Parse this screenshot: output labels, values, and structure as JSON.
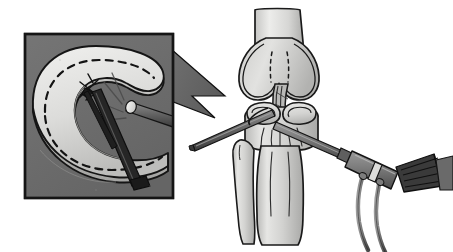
{
  "figure": {
    "title": "Arthroscopic meniscal repair of the knee",
    "description": "Medical line illustration. Left: shaded inset box with callout arrow showing magnified arthroscopic view of a C-shaped meniscus with a dashed tear line, a suture stitch, an arthroscope tip emitting light and a dark suture-passing instrument. Right: anterior view of the knee joint with distal femur, condyles, cruciate ligament, tibial plateau with both menisci, tibia and fibula, a probe entering from the left and an arthroscope with light-cable and two flexible tubes entering from the right.",
    "type": "medical-diagram",
    "width": 453,
    "height": 252,
    "background": "#ffffff"
  },
  "palette": {
    "page_background": "#ffffff",
    "inset_background": "#6e6e6e",
    "inset_border": "#1a1a1a",
    "callout_arrow_fill": "#6e6e6e",
    "callout_arrow_stroke": "#111111",
    "bone_light": "#e3e3e1",
    "bone_mid": "#c8c8c6",
    "bone_shadow": "#a6a6a4",
    "cartilage": "#d4d4d2",
    "meniscus_light": "#dedede",
    "meniscus_mid": "#bdbdbd",
    "outline": "#1a1a1a",
    "instrument_dark": "#2a2a2a",
    "instrument_mid": "#707070",
    "instrument_light": "#9a9a9a",
    "scope_body": "#7a7a7a",
    "scope_band": "#d8d8d8",
    "cable_fill": "#8a8a8a",
    "tear_line": "#141414"
  },
  "inset_panel": {
    "name": "magnified-arthroscopic-view",
    "label": "Magnified arthroscopic view of meniscus repair",
    "box": {
      "x": 25,
      "y": 34,
      "width": 148,
      "height": 164
    },
    "contents": [
      {
        "name": "meniscus-c-shape",
        "label": "C-shaped meniscus body"
      },
      {
        "name": "meniscus-tear-line",
        "label": "Dashed tear line along meniscus"
      },
      {
        "name": "suture-stitch",
        "label": "Suture stitch crossing the tear"
      },
      {
        "name": "grasper-instrument",
        "label": "Suture passing instrument"
      },
      {
        "name": "arthroscope-tip",
        "label": "Arthroscope tip with illumination"
      },
      {
        "name": "light-rays",
        "label": "Light rays from arthroscope"
      }
    ]
  },
  "callout": {
    "name": "callout-arrow",
    "label": "Callout arrow from knee joint to magnified inset",
    "direction": "left"
  },
  "knee_panel": {
    "name": "knee-joint-anterior-view",
    "label": "Anterior view of knee joint",
    "parts": [
      {
        "name": "femur-shaft",
        "label": "Femur shaft"
      },
      {
        "name": "medial-femoral-condyle",
        "label": "Medial femoral condyle"
      },
      {
        "name": "lateral-femoral-condyle",
        "label": "Lateral femoral condyle"
      },
      {
        "name": "intercondylar-notch",
        "label": "Intercondylar notch"
      },
      {
        "name": "cruciate-ligament",
        "label": "Cruciate ligament"
      },
      {
        "name": "medial-meniscus",
        "label": "Medial meniscus"
      },
      {
        "name": "lateral-meniscus",
        "label": "Lateral meniscus"
      },
      {
        "name": "tibial-plateau",
        "label": "Tibial plateau"
      },
      {
        "name": "tibia-shaft",
        "label": "Tibia shaft"
      },
      {
        "name": "fibula",
        "label": "Fibula"
      },
      {
        "name": "probe-instrument",
        "label": "Arthroscopic probe entering from lateral portal"
      },
      {
        "name": "arthroscope",
        "label": "Arthroscope with camera head"
      },
      {
        "name": "fiber-optic-bundle",
        "label": "Fiber optic light bundle"
      },
      {
        "name": "scope-cable-upper",
        "label": "Upper flexible cable"
      },
      {
        "name": "scope-cable-lower",
        "label": "Lower flexible cable"
      }
    ]
  }
}
